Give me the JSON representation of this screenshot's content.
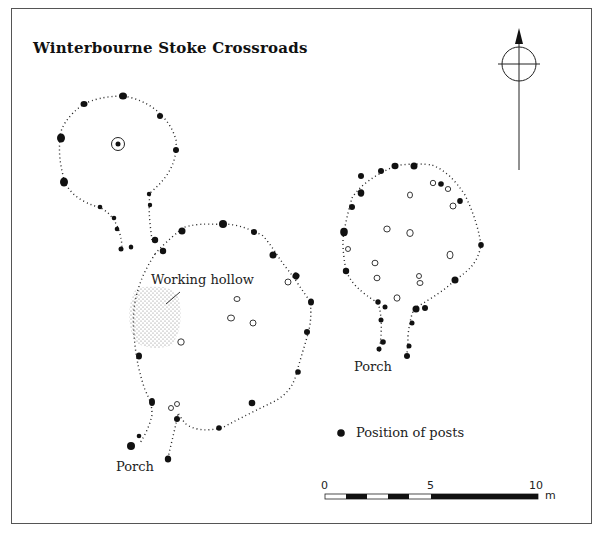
{
  "title": "Winterbourne Stoke Crossroads",
  "labels": {
    "working_hollow": "Working hollow",
    "porch_left": "Porch",
    "porch_right": "Porch"
  },
  "legend": {
    "posts_label": "Position of posts"
  },
  "scale_bar": {
    "tick_0": "0",
    "tick_5": "5",
    "tick_10": "10",
    "unit": "m"
  },
  "north_arrow": {
    "icon": "north-arrow-icon"
  },
  "colors": {
    "ink": "#111111",
    "frame": "#555555",
    "hollow_stipple": "#888888"
  }
}
